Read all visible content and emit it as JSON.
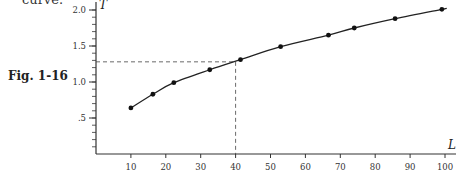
{
  "page": {
    "top_text": "curve.",
    "figure_label": "Fig. 1-16"
  },
  "chart_data": {
    "type": "line",
    "title": "",
    "xlabel": "L",
    "ylabel": "T",
    "xlim": [
      0,
      104
    ],
    "ylim": [
      0,
      2.1
    ],
    "x_ticks": [
      10,
      20,
      30,
      40,
      50,
      60,
      70,
      80,
      90,
      100
    ],
    "x_tick_labels": [
      "10",
      "20",
      "30",
      "40",
      "50",
      "60",
      "70",
      "80",
      "90",
      "100"
    ],
    "y_ticks": [
      0.5,
      1.0,
      1.5,
      2.0
    ],
    "y_tick_labels": [
      ".5",
      "1.0",
      "1.5",
      "2.0"
    ],
    "y_minor_tick_step": 0.1,
    "grid": false,
    "legend": null,
    "series": [
      {
        "name": "T vs L",
        "markers": true,
        "smooth": true,
        "x": [
          10,
          16.3,
          22.3,
          32.6,
          41.4,
          52.9,
          66.6,
          74.0,
          85.7,
          99.1
        ],
        "y": [
          0.64,
          0.83,
          0.99,
          1.17,
          1.31,
          1.49,
          1.65,
          1.75,
          1.88,
          2.01
        ]
      }
    ],
    "annotations": [
      {
        "type": "dashed-guide",
        "x": 40,
        "y": 1.28,
        "description": "Dashed lines from L=40 up to curve and across to T axis at about 1.28"
      }
    ]
  }
}
